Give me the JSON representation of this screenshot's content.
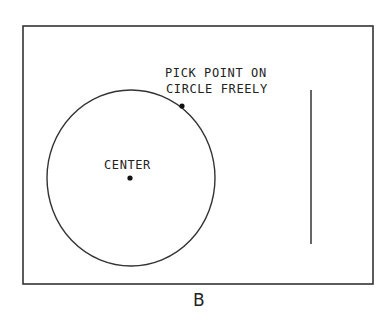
{
  "diagram": {
    "type": "CAD circle construction illustration",
    "stroke_color": "#333333",
    "background": "#ffffff",
    "frame": {
      "x": 23,
      "y": 26,
      "width": 350,
      "height": 258
    },
    "circle": {
      "cx": 131,
      "cy": 178,
      "rx": 84,
      "ry": 88
    },
    "center_point": {
      "x": 130,
      "y": 178,
      "label": "CENTER"
    },
    "pick_point": {
      "x": 182,
      "y": 106
    },
    "instruction": {
      "line1": "PICK POINT ON",
      "line2": "CIRCLE FREELY"
    },
    "vertical_line": {
      "x": 311,
      "y1": 90,
      "y2": 244
    },
    "caption": "B"
  }
}
